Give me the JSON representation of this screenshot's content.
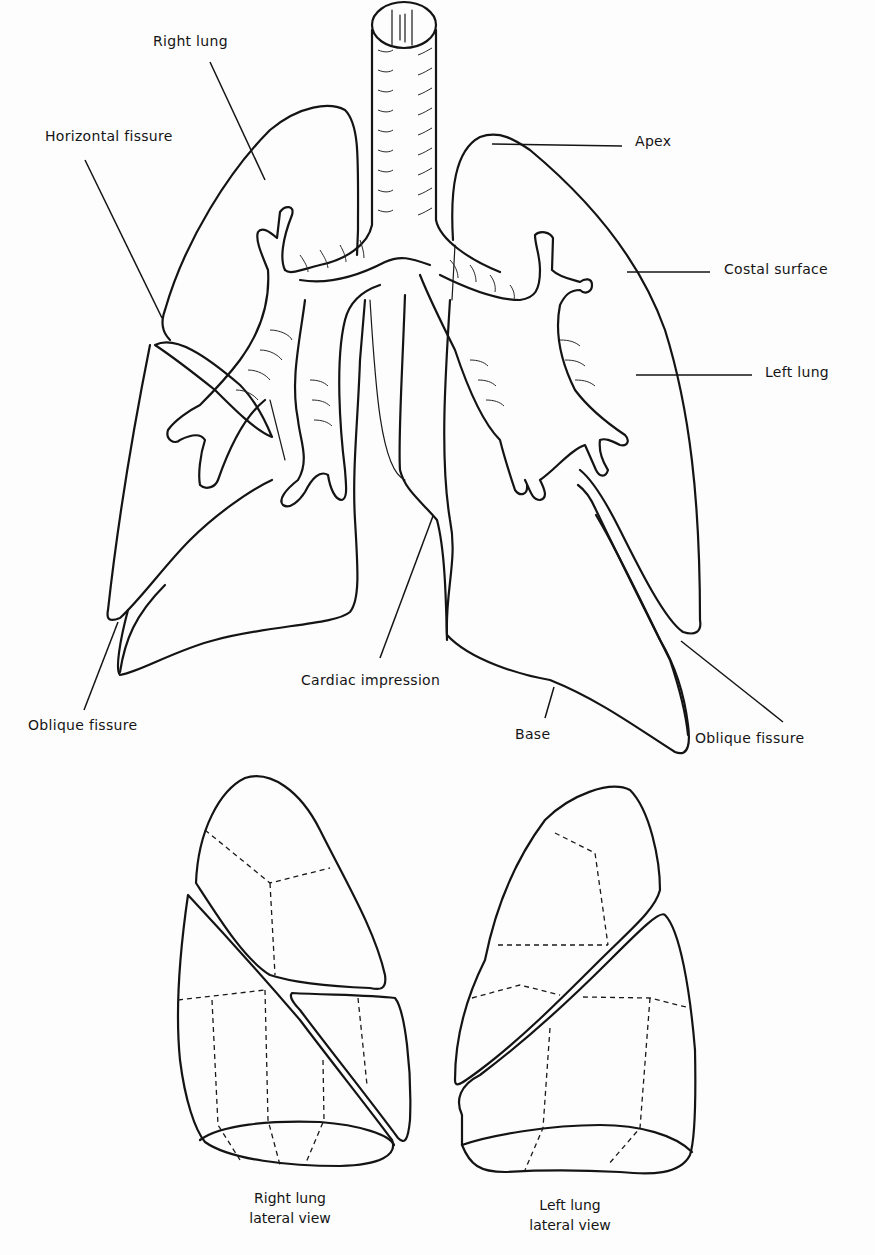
{
  "figure": {
    "type": "anatomical line drawing"
  },
  "labels": {
    "right_lung": "Right lung",
    "horizontal_fissure": "Horizontal fissure",
    "apex": "Apex",
    "costal_surface": "Costal surface",
    "left_lung": "Left lung",
    "cardiac_impression": "Cardiac impression",
    "oblique_fissure_right": "Oblique fissure",
    "oblique_fissure_left": "Oblique fissure",
    "base": "Base"
  },
  "captions": {
    "right_lateral_line1": "Right lung",
    "right_lateral_line2": "lateral view",
    "left_lateral_line1": "Left lung",
    "left_lateral_line2": "lateral view"
  },
  "colors": {
    "ink": "#141414",
    "paper": "#fdfdfd"
  }
}
